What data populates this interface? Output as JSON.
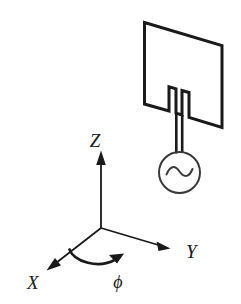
{
  "figure": {
    "background_color": "#ffffff",
    "line_color": "#1a1a1a",
    "thin_line_color": "#3a3a3a"
  },
  "axes": {
    "origin_label": "",
    "z_label": "Z",
    "x_label": "X",
    "y_label": "Y",
    "angle_label": "ϕ"
  },
  "antenna": {
    "patch_name": "rectangular-patch",
    "feed_name": "microstrip-feed-line",
    "source_name": "ac-source",
    "source_symbol": "∿"
  }
}
